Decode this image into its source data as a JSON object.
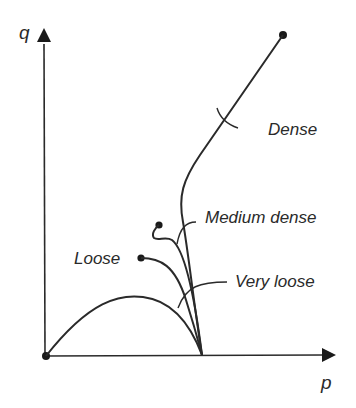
{
  "axes": {
    "x_label": "p",
    "y_label": "q"
  },
  "curves": [
    {
      "name": "Dense",
      "label": "Dense"
    },
    {
      "name": "Medium dense",
      "label": "Medium dense"
    },
    {
      "name": "Loose",
      "label": "Loose"
    },
    {
      "name": "Very loose",
      "label": "Very loose"
    }
  ],
  "colors": {
    "line": "#2a2a2a",
    "background": "#ffffff"
  }
}
